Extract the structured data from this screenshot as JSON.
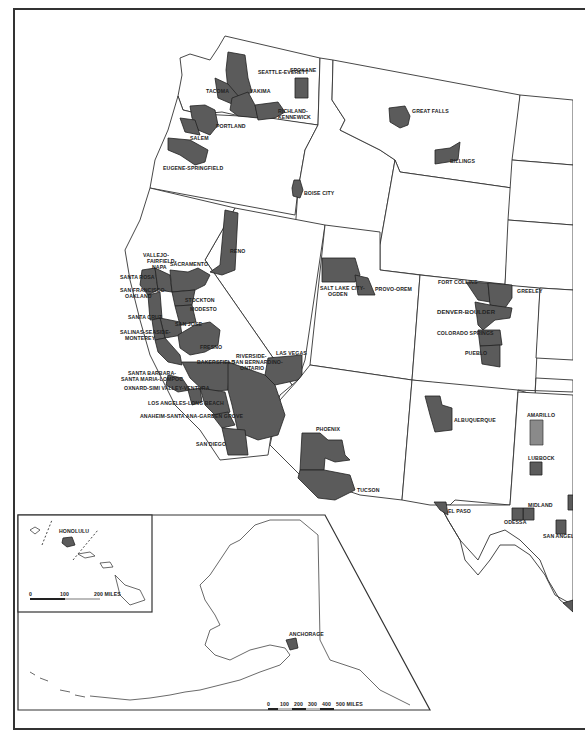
{
  "map": {
    "title": "",
    "region": "Western United States — Standard Metropolitan Statistical Areas",
    "colors": {
      "metro_fill": "#5b5b5b",
      "metro_fill_light": "#8a8a8a",
      "state_fill": "#ffffff",
      "border": "#333333"
    },
    "labels": {
      "seattle_everett": "SEATTLE-EVERETT",
      "spokane": "SPOKANE",
      "tacoma": "TACOMA",
      "yakima": "YAKIMA",
      "richland_kennewick": "RICHLAND-\nKENNEWICK",
      "richland": "RICHLAND-",
      "kennewick": "KENNEWICK",
      "portland": "PORTLAND",
      "salem": "SALEM",
      "eugene_springfield": "EUGENE-SPRINGFIELD",
      "great_falls": "GREAT FALLS",
      "billings": "BILLINGS",
      "boise_city": "BOISE CITY",
      "reno": "RENO",
      "vallejo": "VALLEJO-",
      "fairfield": "FAIRFIELD-",
      "napa": "NAPA",
      "sacramento": "SACRAMENTO",
      "santa_rosa": "SANTA ROSA",
      "san_francisco": "SAN FRANCISCO-",
      "oakland": "OAKLAND",
      "stockton": "STOCKTON",
      "modesto": "MODESTO",
      "santa_cruz": "SANTA CRUZ",
      "san_jose": "SAN JOSE",
      "salinas": "SALINAS-SEASIDE-",
      "monterey": "MONTEREY",
      "fresno": "FRESNO",
      "bakersfield": "BAKERSFIELD",
      "riverside": "RIVERSIDE-",
      "san_bernardino": "SAN BERNARDINO-",
      "ontario": "ONTARIO",
      "las_vegas": "LAS VEGAS",
      "santa_barbara": "SANTA BARBARA-",
      "santa_maria": "SANTA MARIA-LOMPOC",
      "oxnard": "OXNARD-SIMI VALLEY-VENTURA",
      "los_angeles": "LOS ANGELES-LONG BEACH",
      "anaheim": "ANAHEIM-SANTA ANA-GARDEN GROVE",
      "san_diego": "SAN DIEGO",
      "salt_lake": "SALT LAKE CITY-",
      "ogden": "OGDEN",
      "provo": "PROVO-OREM",
      "fort_collins": "FORT COLLINS",
      "greeley": "GREELEY",
      "denver": "DENVER-BOULDER",
      "colorado_springs": "COLORADO SPRINGS",
      "pueblo": "PUEBLO",
      "phoenix": "PHOENIX",
      "tucson": "TUCSON",
      "albuquerque": "ALBUQUERQUE",
      "amarillo": "AMARILLO",
      "lubbock": "LUBBOCK",
      "el_paso": "EL PASO",
      "midland": "MIDLAND",
      "odessa": "ODESSA",
      "san_angelo": "SAN ANGELO",
      "honolulu": "HONOLULU",
      "anchorage": "ANCHORAGE"
    },
    "hawaii_scale": {
      "ticks": [
        "0",
        "100",
        "200 MILES"
      ]
    },
    "alaska_scale": {
      "ticks": [
        "0",
        "100",
        "200",
        "300",
        "400",
        "500 MILES"
      ]
    }
  }
}
